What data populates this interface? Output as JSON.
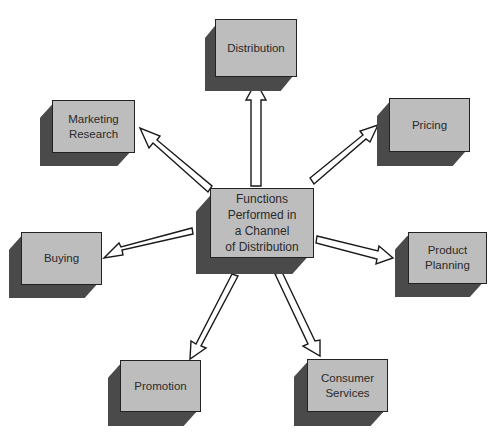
{
  "diagram": {
    "center": {
      "label": "Functions\nPerformed in\na Channel\nof Distribution"
    },
    "functions": [
      {
        "id": "distribution",
        "label": "Distribution"
      },
      {
        "id": "marketing-research",
        "label": "Marketing\nResearch"
      },
      {
        "id": "pricing",
        "label": "Pricing"
      },
      {
        "id": "buying",
        "label": "Buying"
      },
      {
        "id": "product-planning",
        "label": "Product\nPlanning"
      },
      {
        "id": "promotion",
        "label": "Promotion"
      },
      {
        "id": "consumer-services",
        "label": "Consumer\nServices"
      }
    ],
    "colors": {
      "face": "#bdbdbd",
      "shadow": "#4a4a4a",
      "outline": "#222222",
      "arrow_fill": "#ffffff"
    }
  }
}
